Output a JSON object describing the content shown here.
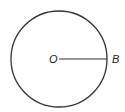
{
  "diagram": {
    "type": "circle-with-radius",
    "circle": {
      "cx": 59,
      "cy": 59,
      "r": 48,
      "stroke": "#333333"
    },
    "radius_segment": {
      "from": "O",
      "to": "B"
    },
    "labels": {
      "center": "O",
      "point": "B"
    }
  }
}
